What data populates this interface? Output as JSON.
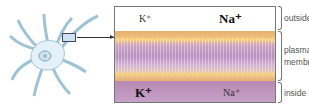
{
  "diagram": {
    "ions_outside": {
      "small": "K⁺",
      "large": "Na⁺"
    },
    "ions_inside": {
      "large": "K⁺",
      "small": "Na⁺"
    },
    "labels": {
      "outside": "outside",
      "membrane_line1": "plasma",
      "membrane_line2": "membrane",
      "inside": "inside"
    },
    "colors": {
      "neuron_fill": "#e4f1f8",
      "neuron_outline": "#9fc3d6",
      "lipid_heads": "#f7d07a",
      "membrane_outer": "#e8b06a",
      "membrane_core": "#b98fc0",
      "inside_fill": "#c8a3c8"
    }
  }
}
